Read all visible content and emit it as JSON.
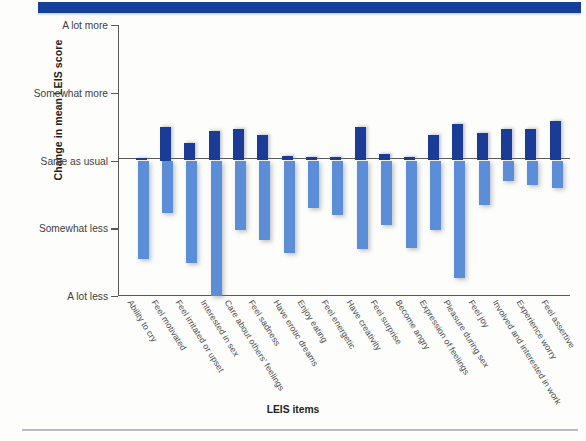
{
  "figure": {
    "banner_color": "#14409a",
    "positive_bar_color": "#1b3c96",
    "negative_bar_color": "#5b8ed6"
  },
  "chart_data": {
    "type": "bar",
    "title": "",
    "subtitle": "",
    "xlabel": "LEIS items",
    "ylabel": "Change in mean LEIS score",
    "grid": false,
    "legend": "none",
    "ylim": [
      -2,
      2
    ],
    "ytick_values": [
      2,
      1,
      0,
      -1,
      -2
    ],
    "ytick_labels": [
      "A lot more",
      "Somewhat more",
      "Same as usual",
      "Somewhat less",
      "A lot less"
    ],
    "categories": [
      "Ability to cry",
      "Feel motivated",
      "Feel irritated or upset",
      "Interested in sex",
      "Care about others' feelings",
      "Feel sadness",
      "Have erotic dreams",
      "Enjoy eating",
      "Feel energetic",
      "Have creativity",
      "Feel surprise",
      "Become angry",
      "Expression of feelings",
      "Pleasure during sex",
      "Feel joy",
      "Involved and interested in work",
      "Experience worry",
      "Feel assertive"
    ],
    "series": [
      {
        "name": "Increase",
        "color": "#1b3c96",
        "values": [
          0.04,
          0.5,
          0.26,
          0.43,
          0.46,
          0.38,
          0.06,
          0.05,
          0.05,
          0.49,
          0.1,
          0.05,
          0.37,
          0.54,
          0.41,
          0.47,
          0.47,
          0.59
        ]
      },
      {
        "name": "Decrease",
        "color": "#5b8ed6",
        "values": [
          -1.46,
          -0.78,
          -1.51,
          -2.0,
          -1.02,
          -1.18,
          -1.37,
          -0.7,
          -0.8,
          -1.3,
          -0.95,
          -1.29,
          -1.02,
          -1.73,
          -0.65,
          -0.3,
          -0.36,
          -0.4
        ]
      }
    ]
  }
}
